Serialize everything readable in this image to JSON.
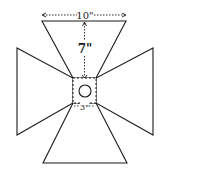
{
  "diagram": {
    "title": "",
    "colors": {
      "stroke": "#1a1a1a",
      "background": "#ffffff"
    },
    "labels": {
      "width_top": "10\"",
      "height_arm": "7\"",
      "center_width": "3\""
    },
    "shapes": [
      {
        "name": "top-arm",
        "type": "trapezoid"
      },
      {
        "name": "left-arm",
        "type": "trapezoid"
      },
      {
        "name": "right-arm",
        "type": "trapezoid"
      },
      {
        "name": "bottom-arm",
        "type": "trapezoid"
      },
      {
        "name": "center-square",
        "type": "dashed-square"
      },
      {
        "name": "center-circle",
        "type": "circle"
      }
    ]
  }
}
